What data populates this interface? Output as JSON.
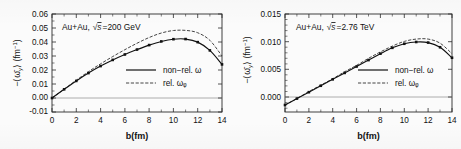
{
  "figure": {
    "background": "#fbfbfb",
    "panel_count": 2
  },
  "chart_data": [
    {
      "type": "line",
      "panel": "left",
      "title": "Au+Au,  √s =200 GeV",
      "annotation": "Au+Au,  √s =200 GeV",
      "xlabel": "b(fm)",
      "ylabel": "−⟨ω̅ᵧ⟩ (fm⁻¹)",
      "xlim": [
        0,
        14
      ],
      "ylim": [
        -0.01,
        0.06
      ],
      "xticks": [
        0,
        2,
        4,
        6,
        8,
        10,
        12,
        14
      ],
      "xtick_labels": [
        "0",
        "2",
        "4",
        "6",
        "8",
        "10",
        "12",
        "14"
      ],
      "yticks": [
        -0.01,
        0.0,
        0.01,
        0.02,
        0.03,
        0.04,
        0.05,
        0.06
      ],
      "ytick_labels": [
        "-0.01",
        "0.00",
        "0.01",
        "0.02",
        "0.03",
        "0.04",
        "0.05",
        "0.06"
      ],
      "grid": false,
      "zero_line": true,
      "legend_position": "center-right",
      "x": [
        0,
        1,
        2,
        3,
        4,
        5,
        6,
        7,
        8,
        9,
        10,
        11,
        12,
        13,
        14
      ],
      "series": [
        {
          "name": "non-rel. ω",
          "style": "solid",
          "markers": true,
          "values": [
            0.0,
            0.0062,
            0.0122,
            0.0178,
            0.0228,
            0.0272,
            0.0311,
            0.0346,
            0.0378,
            0.0404,
            0.042,
            0.0421,
            0.0399,
            0.034,
            0.024
          ]
        },
        {
          "name": "rel. ωᵩ",
          "style": "dashed",
          "markers": false,
          "values": [
            0.0,
            0.0063,
            0.0127,
            0.0188,
            0.0244,
            0.0296,
            0.0345,
            0.0391,
            0.0432,
            0.0464,
            0.0482,
            0.0483,
            0.0466,
            0.0412,
            0.03
          ]
        }
      ]
    },
    {
      "type": "line",
      "panel": "right",
      "title": "Au+Au,  √s =2.76 TeV",
      "annotation": "Au+Au,  √s =2.76 TeV",
      "xlabel": "b(fm)",
      "ylabel": "−⟨ω̅ᵧ⟩ (fm⁻¹)",
      "xlim": [
        0,
        14
      ],
      "ylim": [
        -0.0012,
        0.0156
      ],
      "xticks": [
        0,
        2,
        4,
        6,
        8,
        10,
        12,
        14
      ],
      "xtick_labels": [
        "0",
        "2",
        "4",
        "6",
        "8",
        "10",
        "12",
        "14"
      ],
      "yticks": [
        0.0,
        0.005,
        0.01,
        0.015
      ],
      "ytick_labels": [
        "0.000",
        "0.005",
        "0.010",
        "0.015"
      ],
      "grid": false,
      "zero_line": true,
      "legend_position": "center-right",
      "x": [
        0,
        1,
        2,
        3,
        4,
        5,
        6,
        7,
        8,
        9,
        10,
        11,
        12,
        13,
        14
      ],
      "series": [
        {
          "name": "non-rel. ω",
          "style": "solid",
          "markers": true,
          "values": [
            0.0,
            0.0011,
            0.0022,
            0.0033,
            0.0044,
            0.0055,
            0.0066,
            0.0077,
            0.0088,
            0.0098,
            0.0105,
            0.0108,
            0.0107,
            0.0099,
            0.0081
          ]
        },
        {
          "name": "rel. ωᵩ",
          "style": "dashed",
          "markers": false,
          "values": [
            0.0,
            0.0011,
            0.0023,
            0.0034,
            0.0045,
            0.0057,
            0.0068,
            0.008,
            0.0091,
            0.0101,
            0.0109,
            0.0113,
            0.0113,
            0.0106,
            0.0088
          ]
        }
      ]
    }
  ],
  "legend": {
    "non_rel_label": "non−rel. ω",
    "rel_label": "rel. ωᵩ"
  },
  "axis": {
    "xlabel": "b(fm)",
    "ylabel": "(fm⁻¹)"
  }
}
